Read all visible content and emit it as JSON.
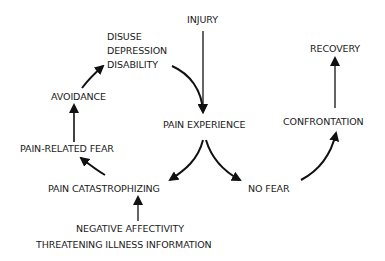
{
  "diagram": {
    "type": "fear-avoidance model flow diagram",
    "nodes": {
      "injury": "INJURY",
      "disuse": "DISUSE",
      "depression": "DEPRESSION",
      "disability": "DISABILITY",
      "pain_experience": "PAIN EXPERIENCE",
      "avoidance": "AVOIDANCE",
      "pain_related_fear": "PAIN-RELATED FEAR",
      "pain_catastrophizing": "PAIN CATASTROPHIZING",
      "no_fear": "NO FEAR",
      "confrontation": "CONFRONTATION",
      "recovery": "RECOVERY",
      "negative_affectivity": "NEGATIVE AFFECTIVITY",
      "threatening_illness_information": "THREATENING ILLNESS INFORMATION"
    },
    "edges": [
      {
        "from": "INJURY",
        "to": "PAIN EXPERIENCE"
      },
      {
        "from": "DISUSE / DEPRESSION / DISABILITY",
        "to": "PAIN EXPERIENCE"
      },
      {
        "from": "PAIN EXPERIENCE",
        "to": "PAIN CATASTROPHIZING"
      },
      {
        "from": "PAIN EXPERIENCE",
        "to": "NO FEAR"
      },
      {
        "from": "PAIN CATASTROPHIZING",
        "to": "PAIN-RELATED FEAR"
      },
      {
        "from": "PAIN-RELATED FEAR",
        "to": "AVOIDANCE"
      },
      {
        "from": "AVOIDANCE",
        "to": "DISUSE / DEPRESSION / DISABILITY"
      },
      {
        "from": "NEGATIVE AFFECTIVITY / THREATENING ILLNESS INFORMATION",
        "to": "PAIN CATASTROPHIZING"
      },
      {
        "from": "NO FEAR",
        "to": "CONFRONTATION"
      },
      {
        "from": "CONFRONTATION",
        "to": "RECOVERY"
      }
    ],
    "colors": {
      "background": "#ffffff",
      "ink": "#1a1a1a"
    }
  }
}
